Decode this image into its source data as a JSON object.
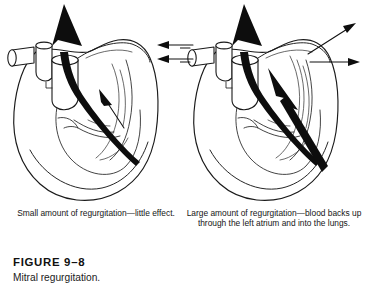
{
  "figure": {
    "label": "FIGURE 9–8",
    "title": "Mitral regurgitation."
  },
  "panels": [
    {
      "id": "small-regurgitation",
      "caption": "Small amount of regurgitation—little effect.",
      "severity": "small",
      "flow_arrows": [
        {
          "name": "aortic-outflow-arrow",
          "style": "thick-solid-black",
          "direction": "up"
        },
        {
          "name": "regurgitation-arrow",
          "style": "thin-solid-black",
          "direction": "up-left",
          "size": "small"
        }
      ],
      "pulmonary-vein-arrows": []
    },
    {
      "id": "large-regurgitation",
      "caption": "Large amount of regurgitation—blood backs up through the left atrium and into the lungs.",
      "severity": "large",
      "flow_arrows": [
        {
          "name": "aortic-outflow-arrow",
          "style": "thick-solid-black",
          "direction": "up"
        },
        {
          "name": "regurgitation-arrow",
          "style": "thick-solid-black",
          "direction": "up-left",
          "size": "large"
        }
      ],
      "pulmonary-vein-arrows": [
        {
          "name": "backflow-arrow-left-upper",
          "direction": "left"
        },
        {
          "name": "backflow-arrow-left-lower",
          "direction": "left"
        },
        {
          "name": "backflow-arrow-right-upper",
          "direction": "up-right"
        },
        {
          "name": "backflow-arrow-right-lower",
          "direction": "right"
        }
      ]
    }
  ],
  "colors": {
    "background": "#ffffff",
    "ink": "#1a1a1a",
    "flow": "#0d0d0d",
    "text": "#151515"
  }
}
